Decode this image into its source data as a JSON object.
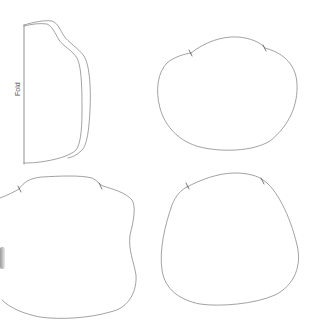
{
  "pattern": {
    "fold_label": "Fold",
    "line_color": "#8a8a8a",
    "notch_color": "#555555",
    "pieces": [
      {
        "name": "fold-piece",
        "position": "top-left"
      },
      {
        "name": "round-piece-top-right",
        "position": "top-right",
        "notches": 2
      },
      {
        "name": "wavy-piece-bottom-left",
        "position": "bottom-left",
        "notches": 2
      },
      {
        "name": "round-piece-bottom-right",
        "position": "bottom-right",
        "notches": 2
      }
    ]
  }
}
